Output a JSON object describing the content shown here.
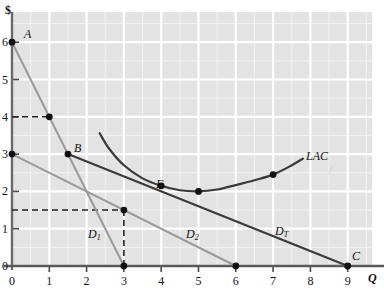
{
  "figure": {
    "y_axis_label": "$",
    "x_axis_label": "Q",
    "background_color": "#e3e3e3",
    "grid_color": "#ffffff",
    "axis_color": "#4a4a4a",
    "dark_curve_color": "#3a3a3a",
    "light_curve_color": "#9a9a9a"
  },
  "ticks": {
    "x": [
      "0",
      "1",
      "2",
      "3",
      "4",
      "5",
      "6",
      "7",
      "8",
      "9"
    ],
    "y": [
      "0",
      "1",
      "2",
      "3",
      "4",
      "5",
      "6"
    ]
  },
  "points": {
    "A": {
      "label": "A",
      "x": 0,
      "y": 6
    },
    "B": {
      "label": "B",
      "x": 1.5,
      "y": 3
    },
    "C": {
      "label": "C",
      "x": 9,
      "y": 0
    },
    "F": {
      "label": "F",
      "x": 4,
      "y": 2.15
    }
  },
  "curve_labels": {
    "d1": {
      "base": "D",
      "sub": "1"
    },
    "d2": {
      "base": "D",
      "sub": "2"
    },
    "dt": {
      "base": "D",
      "sub": "T"
    },
    "lac": {
      "base": "LAC",
      "sub": ""
    }
  },
  "chart_data": {
    "type": "line",
    "title": "",
    "xlabel": "Q",
    "ylabel": "$",
    "xlim": [
      0,
      9.6
    ],
    "ylim": [
      0,
      6.6
    ],
    "grid": true,
    "grid_major_step": 1,
    "grid_minor_step": 0.5,
    "legend": "inline-labels",
    "series": [
      {
        "name": "D1",
        "label": "D₁",
        "color": "#9a9a9a",
        "type": "line",
        "points": [
          {
            "x": 0,
            "y": 6
          },
          {
            "x": 3,
            "y": 0
          }
        ],
        "label_position": {
          "x": 2.3,
          "y": 0.95
        }
      },
      {
        "name": "D2",
        "label": "D₂",
        "color": "#9a9a9a",
        "type": "line",
        "points": [
          {
            "x": 0,
            "y": 3
          },
          {
            "x": 6,
            "y": 0
          }
        ],
        "label_position": {
          "x": 4.7,
          "y": 0.95
        }
      },
      {
        "name": "DT",
        "label": "Dₜ",
        "color": "#3a3a3a",
        "type": "line",
        "points": [
          {
            "x": 1.5,
            "y": 3
          },
          {
            "x": 9,
            "y": 0
          }
        ],
        "label_position": {
          "x": 7.1,
          "y": 1.1
        }
      },
      {
        "name": "LAC",
        "label": "LAC",
        "color": "#3a3a3a",
        "type": "curve",
        "points": [
          {
            "x": 2.35,
            "y": 3.56
          },
          {
            "x": 2.6,
            "y": 3.15
          },
          {
            "x": 3.0,
            "y": 2.7
          },
          {
            "x": 3.5,
            "y": 2.35
          },
          {
            "x": 4.0,
            "y": 2.15
          },
          {
            "x": 4.5,
            "y": 2.03
          },
          {
            "x": 5.0,
            "y": 2.0
          },
          {
            "x": 5.5,
            "y": 2.05
          },
          {
            "x": 6.0,
            "y": 2.17
          },
          {
            "x": 6.5,
            "y": 2.3
          },
          {
            "x": 7.0,
            "y": 2.45
          },
          {
            "x": 7.5,
            "y": 2.7
          },
          {
            "x": 7.8,
            "y": 2.88
          }
        ],
        "label_position": {
          "x": 8.0,
          "y": 3.05
        }
      }
    ],
    "marked_points": [
      {
        "label": "A",
        "x": 0,
        "y": 6,
        "series": "D1"
      },
      {
        "label": "",
        "x": 1,
        "y": 4,
        "series": "D1"
      },
      {
        "label": "B",
        "x": 1.5,
        "y": 3,
        "series": "DT"
      },
      {
        "label": "",
        "x": 0,
        "y": 3,
        "series": "D2"
      },
      {
        "label": "",
        "x": 3,
        "y": 1.5,
        "series": "D2"
      },
      {
        "label": "",
        "x": 3,
        "y": 0,
        "series": "D1"
      },
      {
        "label": "",
        "x": 6,
        "y": 0,
        "series": "D2"
      },
      {
        "label": "C",
        "x": 9,
        "y": 0,
        "series": "DT"
      },
      {
        "label": "F",
        "x": 4,
        "y": 2.15,
        "series": "DT"
      },
      {
        "label": "",
        "x": 5,
        "y": 2.0,
        "series": "LAC"
      },
      {
        "label": "",
        "x": 7,
        "y": 2.45,
        "series": "LAC"
      }
    ],
    "dashed_guides": [
      {
        "from": {
          "x": 0,
          "y": 4
        },
        "to": {
          "x": 1,
          "y": 4
        }
      },
      {
        "from": {
          "x": 0,
          "y": 1.5
        },
        "to": {
          "x": 3,
          "y": 1.5
        }
      },
      {
        "from": {
          "x": 3,
          "y": 1.5
        },
        "to": {
          "x": 3,
          "y": 0
        }
      }
    ]
  }
}
